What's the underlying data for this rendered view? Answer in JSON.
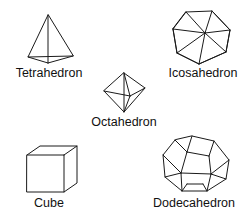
{
  "figure": {
    "background_color": "#ffffff",
    "stroke_color": "#1a1a1a",
    "label_color": "#111111",
    "width": 249,
    "height": 220
  },
  "solids": [
    {
      "id": "tetrahedron",
      "label": "Tetrahedron",
      "faces": 4,
      "label_x": 49,
      "label_y": 77,
      "outline": "48,15 28,57 73,56",
      "edges": [
        "48,15 48,63",
        "28,57 48,63",
        "73,56 48,63"
      ]
    },
    {
      "id": "icosahedron",
      "label": "Icosahedron",
      "faces": 20,
      "label_x": 203,
      "label_y": 77,
      "outline": "186,12 212,11 230,30 226,52 199,64 177,53 173,29",
      "edges": [
        "186,12 173,29",
        "212,11 230,30",
        "186,12 205,33",
        "212,11 205,33",
        "173,29 205,33",
        "230,30 205,33",
        "205,33 199,64",
        "173,29 177,53",
        "230,30 226,52",
        "177,53 205,33",
        "226,52 205,33",
        "177,53 199,64",
        "226,52 199,64"
      ]
    },
    {
      "id": "octahedron",
      "label": "Octahedron",
      "faces": 8,
      "label_x": 124,
      "label_y": 126,
      "outline": "124,73 145,88 124,112 104,91",
      "edges": [
        "124,73 124,112",
        "104,91 130,96",
        "145,88 130,96",
        "124,112 130,96",
        "124,73 130,96"
      ]
    },
    {
      "id": "cube",
      "label": "Cube",
      "faces": 6,
      "label_x": 49,
      "label_y": 207,
      "outline": "27,155 40,146 77,146 77,183 64,192 27,192",
      "edges": [
        "27,155 64,155",
        "64,155 64,192",
        "64,155 77,146"
      ]
    },
    {
      "id": "dodecahedron",
      "label": "Dodecahedron",
      "faces": 12,
      "label_x": 194,
      "label_y": 207,
      "outline": "192,136 214,141 229,160 226,179 207,191 182,191 165,177 163,155 175,140",
      "edges": [
        "192,136 187,152",
        "214,141 209,156",
        "187,152 209,156",
        "187,152 181,173",
        "209,156 211,174",
        "181,173 211,174",
        "175,140 187,152",
        "163,155 181,173",
        "229,160 211,174",
        "165,177 181,173",
        "226,179 211,174",
        "182,191 181,173",
        "207,191 211,174",
        "182,191 187,184",
        "207,191 203,184",
        "187,184 203,184"
      ]
    }
  ]
}
